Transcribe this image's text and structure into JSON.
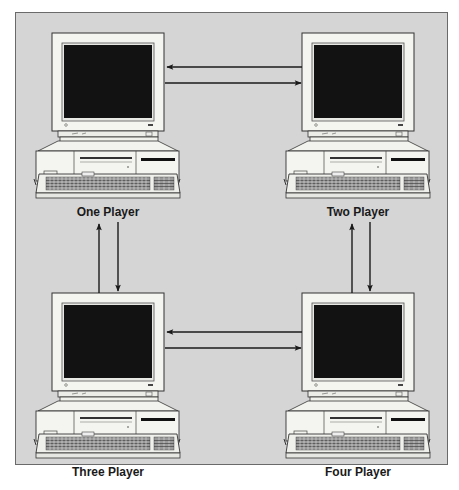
{
  "diagram": {
    "type": "network-topology",
    "colors": {
      "background": "#d5d5d5",
      "frame_border": "#6a6a6a",
      "screen": "#111111",
      "case": "#f2f2ee",
      "arrow": "#1a1a1a"
    },
    "nodes": [
      {
        "id": "one",
        "label": "One Player"
      },
      {
        "id": "two",
        "label": "Two Player"
      },
      {
        "id": "three",
        "label": "Three Player"
      },
      {
        "id": "four",
        "label": "Four Player"
      }
    ],
    "edges": [
      {
        "from": "two",
        "to": "one"
      },
      {
        "from": "one",
        "to": "two"
      },
      {
        "from": "three",
        "to": "one"
      },
      {
        "from": "one",
        "to": "three"
      },
      {
        "from": "four",
        "to": "two"
      },
      {
        "from": "two",
        "to": "four"
      },
      {
        "from": "four",
        "to": "three"
      },
      {
        "from": "three",
        "to": "four"
      }
    ]
  }
}
